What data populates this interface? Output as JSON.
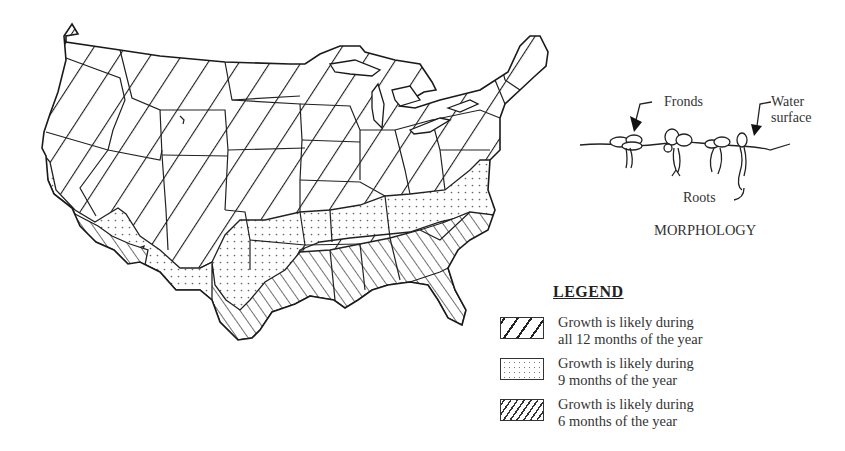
{
  "figure": {
    "type": "map",
    "region": "Contiguous United States",
    "zones": [
      {
        "id": "twelve_months",
        "pattern": "wide-hatch",
        "months": 12
      },
      {
        "id": "nine_months",
        "pattern": "dotted",
        "months": 9
      },
      {
        "id": "six_months",
        "pattern": "dense-hatch",
        "months": 6
      }
    ]
  },
  "morphology": {
    "title": "MORPHOLOGY",
    "labels": {
      "fronds": "Fronds",
      "water_line1": "Water",
      "water_line2": "surface",
      "roots": "Roots"
    }
  },
  "legend": {
    "title": "LEGEND",
    "items": [
      {
        "line1": "Growth is likely during",
        "line2": "all 12 months of the year",
        "pattern": "wide-hatch"
      },
      {
        "line1": "Growth is likely during",
        "line2": "9 months of the year",
        "pattern": "dotted"
      },
      {
        "line1": "Growth is likely during",
        "line2": "6 months of the year",
        "pattern": "dense-hatch"
      }
    ]
  },
  "colors": {
    "ink": "#222222",
    "background": "#ffffff"
  }
}
